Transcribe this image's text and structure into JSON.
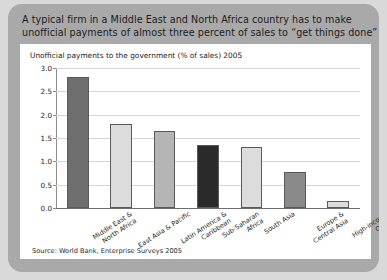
{
  "headline": {
    "line1": "A typical firm in a Middle East and North Africa country has to make",
    "line2": "unofficial payments of almost three percent of sales to “get things done”"
  },
  "panel": {
    "subtitle": "Unofficial payments to the government (% of sales) 2005",
    "source": "Source: World Bank, Enterprise Surveys 2005"
  },
  "chart_data": {
    "type": "bar",
    "title": "Unofficial payments to the government (% of sales) 2005",
    "xlabel": "",
    "ylabel": "",
    "ylim": [
      0.0,
      3.0
    ],
    "yticks": [
      "0.0",
      "0.5",
      "1.0",
      "1.5",
      "2.0",
      "2.5",
      "3.0"
    ],
    "ytick_values": [
      0.0,
      0.5,
      1.0,
      1.5,
      2.0,
      2.5,
      3.0
    ],
    "grid": true,
    "legend": "none",
    "categories": [
      "Middle East & North Africa",
      "East Asia & Pacific",
      "Latin America & Caribbean",
      "Sub-Saharan Africa",
      "South Asia",
      "Europe & Central Asia",
      "High-income OECD"
    ],
    "category_lines": [
      [
        "Middle East &",
        "North Africa"
      ],
      [
        "East Asia & Pacific"
      ],
      [
        "Latin America &",
        "Caribbean"
      ],
      [
        "Sub-Saharan",
        "Africa"
      ],
      [
        "South Asia"
      ],
      [
        "Europe &",
        "Central Asia"
      ],
      [
        "High-income",
        "OECD"
      ]
    ],
    "values": [
      2.8,
      1.8,
      1.65,
      1.35,
      1.3,
      0.78,
      0.15
    ],
    "bar_colors": [
      "#6e6e6e",
      "#dcdcdc",
      "#b5b5b5",
      "#2a2a2a",
      "#dcdcdc",
      "#8a8a8a",
      "#dcdcdc"
    ]
  },
  "colors": {
    "background": "#d9d9d9",
    "card": "#a9a9a9",
    "panel": "#ffffff",
    "grid": "#d4d4d4",
    "axis": "#6d6d6d",
    "text": "#1c1c1c"
  }
}
